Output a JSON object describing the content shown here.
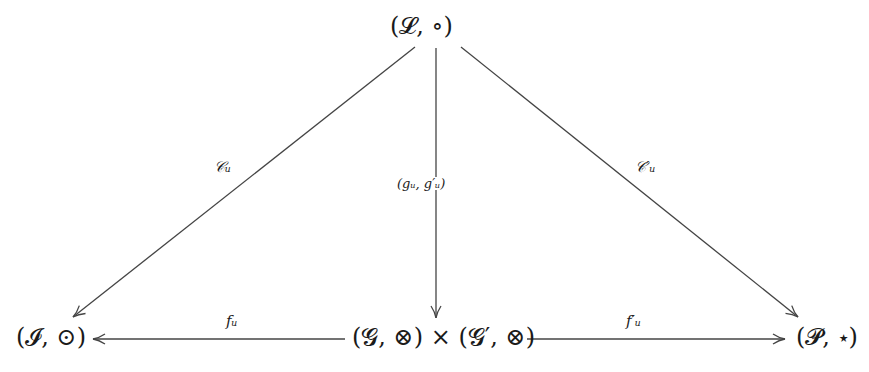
{
  "diagram": {
    "type": "commutative-diagram",
    "nodes": {
      "L": {
        "label": "(𝓛, ∘)"
      },
      "I": {
        "label": "(𝓘, ⊙)"
      },
      "G": {
        "label": "(𝓖, ⊗) × (𝓖′, ⊗)"
      },
      "P": {
        "label": "(𝓟, ⋆)"
      }
    },
    "edges": {
      "L_to_I": {
        "from": "L",
        "to": "I",
        "label": "𝒞ᵤ"
      },
      "L_to_G": {
        "from": "L",
        "to": "G",
        "label": "(gᵤ, g′ᵤ)"
      },
      "L_to_P": {
        "from": "L",
        "to": "P",
        "label": "𝒞′ᵤ"
      },
      "G_to_I": {
        "from": "G",
        "to": "I",
        "label": "fᵤ"
      },
      "G_to_P": {
        "from": "G",
        "to": "P",
        "label": "f′ᵤ"
      }
    },
    "colors": {
      "stroke": "#444444",
      "text": "#1a1a1a",
      "background": "#ffffff"
    }
  }
}
